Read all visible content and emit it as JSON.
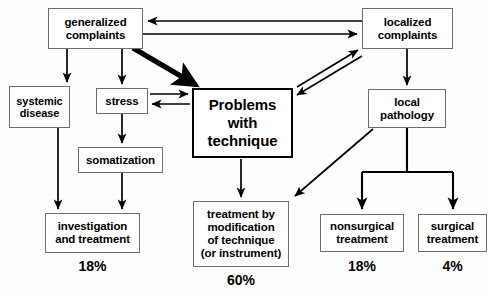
{
  "diagram": {
    "type": "flowchart",
    "colors": {
      "background": "#fdfdfd",
      "node_border": "#6f6f6f",
      "node_emphasis_border": "#000000",
      "edge": "#000000",
      "text": "#000000"
    },
    "nodes": [
      {
        "id": "generalized-complaints",
        "label": "generalized\ncomplaints",
        "line1": "generalized",
        "line2": "complaints",
        "x": 48,
        "y": 8,
        "w": 95,
        "h": 41,
        "emphasis": false
      },
      {
        "id": "localized-complaints",
        "label": "localized\ncomplaints",
        "line1": "localized",
        "line2": "complaints",
        "x": 362,
        "y": 8,
        "w": 91,
        "h": 41,
        "emphasis": false
      },
      {
        "id": "systemic-disease",
        "label": "systemic\ndisease",
        "line1": "systemic",
        "line2": "disease",
        "x": 9,
        "y": 86,
        "w": 61,
        "h": 42,
        "emphasis": false
      },
      {
        "id": "stress",
        "label": "stress",
        "line1": "stress",
        "line2": "",
        "x": 96,
        "y": 88,
        "w": 52,
        "h": 26,
        "emphasis": false
      },
      {
        "id": "problems-with-technique",
        "label": "Problems\nwith\ntechnique",
        "line1": "Problems",
        "line2": "with",
        "line3": "technique",
        "x": 192,
        "y": 88,
        "w": 101,
        "h": 70,
        "emphasis": true
      },
      {
        "id": "local-pathology",
        "label": "local\npathology",
        "line1": "local",
        "line2": "pathology",
        "x": 368,
        "y": 89,
        "w": 78,
        "h": 39,
        "emphasis": false
      },
      {
        "id": "somatization",
        "label": "somatization",
        "line1": "somatization",
        "line2": "",
        "x": 78,
        "y": 147,
        "w": 85,
        "h": 26,
        "emphasis": false
      },
      {
        "id": "investigation-and-treatment",
        "label": "investigation\nand treatment",
        "line1": "investigation",
        "line2": "and treatment",
        "x": 45,
        "y": 213,
        "w": 95,
        "h": 40,
        "emphasis": false
      },
      {
        "id": "treatment-by-modification",
        "label": "treatment by\nmodification\nof technique\n(or instrument)",
        "line1": "treatment by",
        "line2": "modification",
        "line3": "of technique",
        "line4": "(or instrument)",
        "x": 193,
        "y": 201,
        "w": 96,
        "h": 66,
        "emphasis": false
      },
      {
        "id": "nonsurgical-treatment",
        "label": "nonsurgical\ntreatment",
        "line1": "nonsurgical",
        "line2": "treatment",
        "x": 320,
        "y": 214,
        "w": 84,
        "h": 38,
        "emphasis": false
      },
      {
        "id": "surgical-treatment",
        "label": "surgical\ntreatment",
        "line1": "surgical",
        "line2": "treatment",
        "x": 418,
        "y": 214,
        "w": 69,
        "h": 38,
        "emphasis": false
      }
    ],
    "percentages": [
      {
        "id": "pct-investigation",
        "value": "18%",
        "for": "investigation-and-treatment",
        "x": 45,
        "y": 258,
        "w": 95
      },
      {
        "id": "pct-treatment-modification",
        "value": "60%",
        "for": "treatment-by-modification",
        "x": 193,
        "y": 272,
        "w": 96
      },
      {
        "id": "pct-nonsurgical",
        "value": "18%",
        "for": "nonsurgical-treatment",
        "x": 320,
        "y": 258,
        "w": 84
      },
      {
        "id": "pct-surgical",
        "value": "4%",
        "for": "surgical-treatment",
        "x": 418,
        "y": 258,
        "w": 69
      }
    ],
    "edges": [
      {
        "id": "localized-to-generalized",
        "from": "localized-complaints",
        "to": "generalized-complaints",
        "style": "thin",
        "direction": "left"
      },
      {
        "id": "generalized-to-localized",
        "from": "generalized-complaints",
        "to": "localized-complaints",
        "style": "thin",
        "direction": "right"
      },
      {
        "id": "generalized-to-systemic",
        "from": "generalized-complaints",
        "to": "systemic-disease",
        "style": "thin",
        "direction": "down"
      },
      {
        "id": "generalized-to-stress",
        "from": "generalized-complaints",
        "to": "stress",
        "style": "thin",
        "direction": "down"
      },
      {
        "id": "generalized-to-problems",
        "from": "generalized-complaints",
        "to": "problems-with-technique",
        "style": "thick",
        "direction": "diagonal-down-right"
      },
      {
        "id": "stress-to-problems",
        "from": "stress",
        "to": "problems-with-technique",
        "style": "thin",
        "direction": "right"
      },
      {
        "id": "problems-to-stress",
        "from": "problems-with-technique",
        "to": "stress",
        "style": "thin",
        "direction": "left"
      },
      {
        "id": "problems-to-localized",
        "from": "problems-with-technique",
        "to": "localized-complaints",
        "style": "thin",
        "direction": "diagonal-up-right"
      },
      {
        "id": "localized-to-problems",
        "from": "localized-complaints",
        "to": "problems-with-technique",
        "style": "thin",
        "direction": "diagonal-down-left"
      },
      {
        "id": "stress-to-somatization",
        "from": "stress",
        "to": "somatization",
        "style": "thin",
        "direction": "down"
      },
      {
        "id": "systemic-to-investigation",
        "from": "systemic-disease",
        "to": "investigation-and-treatment",
        "style": "thin",
        "direction": "down"
      },
      {
        "id": "somatization-to-investigation",
        "from": "somatization",
        "to": "investigation-and-treatment",
        "style": "thin",
        "direction": "down"
      },
      {
        "id": "problems-to-treatment",
        "from": "problems-with-technique",
        "to": "treatment-by-modification",
        "style": "thin",
        "direction": "down"
      },
      {
        "id": "localized-to-local-pathology",
        "from": "localized-complaints",
        "to": "local-pathology",
        "style": "thin",
        "direction": "down"
      },
      {
        "id": "local-pathology-to-treatment",
        "from": "local-pathology",
        "to": "treatment-by-modification",
        "style": "thin",
        "direction": "diagonal-down-left"
      },
      {
        "id": "local-pathology-to-nonsurgical",
        "from": "local-pathology",
        "to": "nonsurgical-treatment",
        "style": "thin",
        "direction": "down-branch"
      },
      {
        "id": "local-pathology-to-surgical",
        "from": "local-pathology",
        "to": "surgical-treatment",
        "style": "thin",
        "direction": "down-branch"
      }
    ]
  }
}
